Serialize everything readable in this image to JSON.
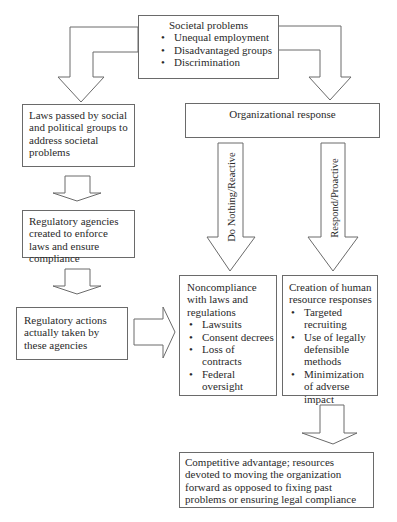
{
  "top_box": {
    "title": "Societal problems",
    "items": [
      "Unequal employment",
      "Disadvantaged groups",
      "Discrimination"
    ]
  },
  "left_column": {
    "laws_box": "Laws passed by social and political groups to address societal problems",
    "agencies_box": "Regulatory agencies created to enforce laws and ensure compliance",
    "actions_box": "Regulatory actions actually taken by these agencies"
  },
  "org_response_box": "Organizational response",
  "arrow_labels": {
    "reactive": "Do Nothing/Reactive",
    "proactive": "Respond/Proactive"
  },
  "noncompliance_box": {
    "title": "Noncompliance with laws and regulations",
    "items": [
      "Lawsuits",
      "Consent decrees",
      "Loss of contracts",
      "Federal oversight"
    ]
  },
  "hr_box": {
    "title": "Creation of human resource responses",
    "items": [
      "Targeted recruiting",
      "Use of legally defensible methods",
      "Minimization of adverse impact"
    ]
  },
  "outcome_box": "Competitive advantage; resources devoted to moving the organization forward as opposed to fixing past problems or ensuring legal compliance",
  "colors": {
    "line": "#6a6a6a",
    "text": "#2a2a2a",
    "background": "#ffffff"
  }
}
